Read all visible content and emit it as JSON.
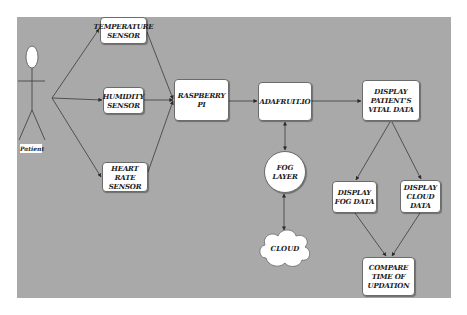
{
  "diagram": {
    "actor": {
      "label": "Patient"
    },
    "sensors": [
      {
        "id": "temperature",
        "label": "TEMPERATURE SENSOR"
      },
      {
        "id": "humidity",
        "label": "HUMIDITY SENSOR"
      },
      {
        "id": "heart_rate",
        "label": "HEART RATE SENSOR"
      }
    ],
    "nodes": {
      "raspberry_pi": "RASPBERRY PI",
      "adafruit": "ADAFRUIT.IO",
      "display_vital": "DISPLAY PATIENT'S VITAL DATA",
      "fog_layer": "FOG LAYER",
      "cloud": "CLOUD",
      "display_fog": "DISPLAY FOG DATA",
      "display_cloud": "DISPLAY CLOUD DATA",
      "compare": "COMPARE TIME OF UPDATION"
    },
    "colors": {
      "canvas": "#a9a9a9",
      "node_fill": "#ffffff",
      "line": "#3a3a3a"
    },
    "edges": [
      [
        "Patient",
        "TEMPERATURE SENSOR"
      ],
      [
        "Patient",
        "HUMIDITY SENSOR"
      ],
      [
        "Patient",
        "HEART RATE SENSOR"
      ],
      [
        "TEMPERATURE SENSOR",
        "RASPBERRY PI"
      ],
      [
        "HUMIDITY SENSOR",
        "RASPBERRY PI"
      ],
      [
        "HEART RATE SENSOR",
        "RASPBERRY PI"
      ],
      [
        "RASPBERRY PI",
        "ADAFRUIT.IO"
      ],
      [
        "ADAFRUIT.IO",
        "DISPLAY PATIENT'S VITAL DATA"
      ],
      [
        "ADAFRUIT.IO",
        "FOG LAYER",
        "bidirectional"
      ],
      [
        "FOG LAYER",
        "CLOUD",
        "bidirectional"
      ],
      [
        "DISPLAY PATIENT'S VITAL DATA",
        "DISPLAY FOG DATA"
      ],
      [
        "DISPLAY PATIENT'S VITAL DATA",
        "DISPLAY CLOUD DATA"
      ],
      [
        "DISPLAY FOG DATA",
        "COMPARE TIME OF UPDATION"
      ],
      [
        "DISPLAY CLOUD DATA",
        "COMPARE TIME OF UPDATION"
      ]
    ]
  }
}
